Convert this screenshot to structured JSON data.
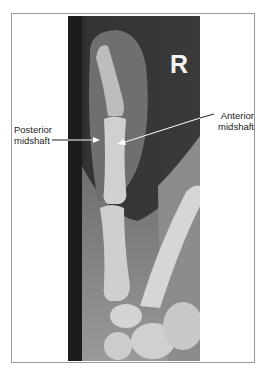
{
  "figure": {
    "side_marker": "R",
    "annotations": [
      {
        "id": "posterior",
        "line1": "Posterior",
        "line2": "midshaft"
      },
      {
        "id": "anterior",
        "line1": "Anterior",
        "line2": "midshaft"
      }
    ],
    "colors": {
      "frame_border": "#9a9a9a",
      "xray_background": "#2b2b2b",
      "bone": "#d8d8d8",
      "soft_tissue": "#8a8a8a",
      "arrow": "#ffffff",
      "label_text": "#222222"
    }
  }
}
